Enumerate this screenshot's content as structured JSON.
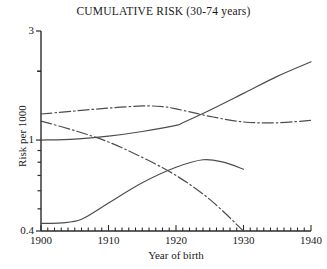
{
  "chart_data": {
    "type": "line",
    "title": "CUMULATIVE RISK (30-74 years)",
    "xlabel": "Year of birth",
    "ylabel": "Risk per 1000",
    "xlim": [
      1900,
      1940
    ],
    "ylim": [
      0.4,
      3
    ],
    "yscale": "log",
    "grid": false,
    "legend": "none",
    "x_ticks_major": [
      1900,
      1910,
      1920,
      1930,
      1940
    ],
    "x_tick_labels": [
      "1900",
      "1910",
      "1920",
      "1930",
      "1940"
    ],
    "x_minor_tick_interval": 1,
    "y_ticks": [
      0.4,
      0.5,
      0.6,
      0.7,
      0.8,
      0.9,
      1,
      2,
      3
    ],
    "y_tick_labels_shown": [
      "3",
      "1",
      "0.4"
    ],
    "series": [
      {
        "name": "series-rising-solid",
        "style": "solid",
        "color": "#4d4d4d",
        "points": [
          [
            1900,
            1.0
          ],
          [
            1905,
            1.01
          ],
          [
            1910,
            1.04
          ],
          [
            1915,
            1.09
          ],
          [
            1920,
            1.16
          ],
          [
            1921,
            1.19
          ],
          [
            1925,
            1.35
          ],
          [
            1930,
            1.6
          ],
          [
            1935,
            1.9
          ],
          [
            1940,
            2.2
          ]
        ]
      },
      {
        "name": "series-peaked-dashdot",
        "style": "dash-dot",
        "color": "#4d4d4d",
        "points": [
          [
            1900,
            1.3
          ],
          [
            1905,
            1.34
          ],
          [
            1910,
            1.38
          ],
          [
            1915,
            1.41
          ],
          [
            1918,
            1.4
          ],
          [
            1920,
            1.37
          ],
          [
            1925,
            1.27
          ],
          [
            1930,
            1.2
          ],
          [
            1935,
            1.19
          ],
          [
            1940,
            1.22
          ]
        ]
      },
      {
        "name": "series-declining-dashdot",
        "style": "dash-dot",
        "color": "#4d4d4d",
        "points": [
          [
            1900,
            1.21
          ],
          [
            1905,
            1.1
          ],
          [
            1910,
            0.98
          ],
          [
            1915,
            0.84
          ],
          [
            1920,
            0.7
          ],
          [
            1925,
            0.55
          ],
          [
            1930,
            0.4
          ]
        ]
      },
      {
        "name": "series-low-solid",
        "style": "solid",
        "color": "#4d4d4d",
        "points": [
          [
            1900,
            0.432
          ],
          [
            1903,
            0.434
          ],
          [
            1906,
            0.45
          ],
          [
            1910,
            0.53
          ],
          [
            1915,
            0.65
          ],
          [
            1920,
            0.76
          ],
          [
            1924,
            0.82
          ],
          [
            1927,
            0.8
          ],
          [
            1930,
            0.745
          ]
        ]
      }
    ]
  }
}
